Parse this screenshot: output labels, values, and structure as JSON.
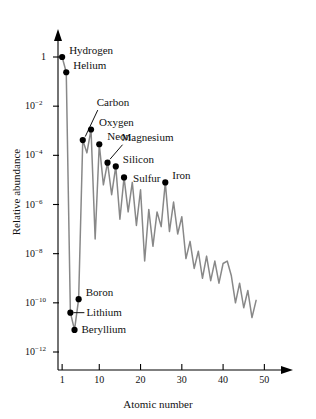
{
  "chart_data": {
    "type": "line",
    "title": "",
    "xlabel": "Atomic number",
    "ylabel": "Relative abundance",
    "xlim": [
      0,
      55
    ],
    "ylim_log10": [
      -12.6,
      0.45
    ],
    "grid": false,
    "legend": "none",
    "line_color": "#888888",
    "marker_color": "#000000",
    "x_ticks": [
      "1",
      "10",
      "20",
      "30",
      "40",
      "50"
    ],
    "x_tick_values": [
      1,
      10,
      20,
      30,
      40,
      50
    ],
    "y_ticks": [
      "1",
      "10⁻²",
      "10⁻⁴",
      "10⁻⁶",
      "10⁻⁸",
      "10⁻¹⁰",
      "10⁻¹²"
    ],
    "y_tick_exponents": [
      0,
      -2,
      -4,
      -6,
      -8,
      -10,
      -12
    ],
    "x": [
      1,
      2,
      3,
      4,
      5,
      6,
      7,
      8,
      9,
      10,
      11,
      12,
      13,
      14,
      15,
      16,
      17,
      18,
      19,
      20,
      21,
      22,
      23,
      24,
      25,
      26,
      27,
      28,
      29,
      30,
      31,
      32,
      33,
      34,
      35,
      36,
      37,
      38,
      39,
      40,
      41,
      42,
      43,
      44,
      45,
      46,
      47,
      48
    ],
    "y_log10": [
      0,
      -0.62,
      -10.4,
      -11.1,
      -9.85,
      -3.38,
      -3.9,
      -2.95,
      -7.4,
      -3.55,
      -5.2,
      -4.3,
      -5.6,
      -4.45,
      -6.6,
      -4.9,
      -6.3,
      -5.1,
      -6.85,
      -5.4,
      -8.3,
      -6.2,
      -7.7,
      -6.3,
      -6.9,
      -5.1,
      -7.1,
      -5.9,
      -7.2,
      -6.5,
      -8.2,
      -7.5,
      -8.6,
      -7.9,
      -9.0,
      -8.1,
      -9.1,
      -8.3,
      -9.2,
      -8.4,
      -8.3,
      -8.9,
      -10.0,
      -9.2,
      -10.2,
      -9.5,
      -10.6,
      -9.9
    ],
    "annotations": [
      {
        "label": "Hydrogen",
        "z": 1,
        "y_log10": 0,
        "leader": "none"
      },
      {
        "label": "Helium",
        "z": 2,
        "y_log10": -0.62,
        "leader": "none"
      },
      {
        "label": "Carbon",
        "z": 6,
        "y_log10": -3.38,
        "leader": "diagonal"
      },
      {
        "label": "Oxygen",
        "z": 8,
        "y_log10": -2.95,
        "leader": "none"
      },
      {
        "label": "Neon",
        "z": 10,
        "y_log10": -3.55,
        "leader": "none"
      },
      {
        "label": "Magnesium",
        "z": 12,
        "y_log10": -4.3,
        "leader": "diagonal"
      },
      {
        "label": "Silicon",
        "z": 14,
        "y_log10": -4.45,
        "leader": "none"
      },
      {
        "label": "Sulfur",
        "z": 16,
        "y_log10": -4.9,
        "leader": "none"
      },
      {
        "label": "Iron",
        "z": 26,
        "y_log10": -5.1,
        "leader": "none"
      },
      {
        "label": "Boron",
        "z": 5,
        "y_log10": -9.85,
        "leader": "none"
      },
      {
        "label": "Lithium",
        "z": 3,
        "y_log10": -10.4,
        "leader": "horizontal"
      },
      {
        "label": "Beryllium",
        "z": 4,
        "y_log10": -11.1,
        "leader": "none"
      }
    ]
  },
  "axes": {
    "x_title": "Atomic number",
    "y_title": "Relative abundance"
  },
  "labels": {
    "hydrogen": "Hydrogen",
    "helium": "Helium",
    "carbon": "Carbon",
    "oxygen": "Oxygen",
    "neon": "Neon",
    "magnesium": "Magnesium",
    "silicon": "Silicon",
    "sulfur": "Sulfur",
    "iron": "Iron",
    "boron": "Boron",
    "lithium": "Lithium",
    "beryllium": "Beryllium"
  },
  "x_tick_labels": {
    "t1": "1",
    "t2": "10",
    "t3": "20",
    "t4": "30",
    "t5": "40",
    "t6": "50"
  },
  "y_tick_labels": {
    "t1": "1",
    "t2": "10",
    "t2exp": "−2",
    "t3": "10",
    "t3exp": "−4",
    "t4": "10",
    "t4exp": "−6",
    "t5": "10",
    "t5exp": "−8",
    "t6": "10",
    "t6exp": "−10",
    "t7": "10",
    "t7exp": "−12"
  }
}
